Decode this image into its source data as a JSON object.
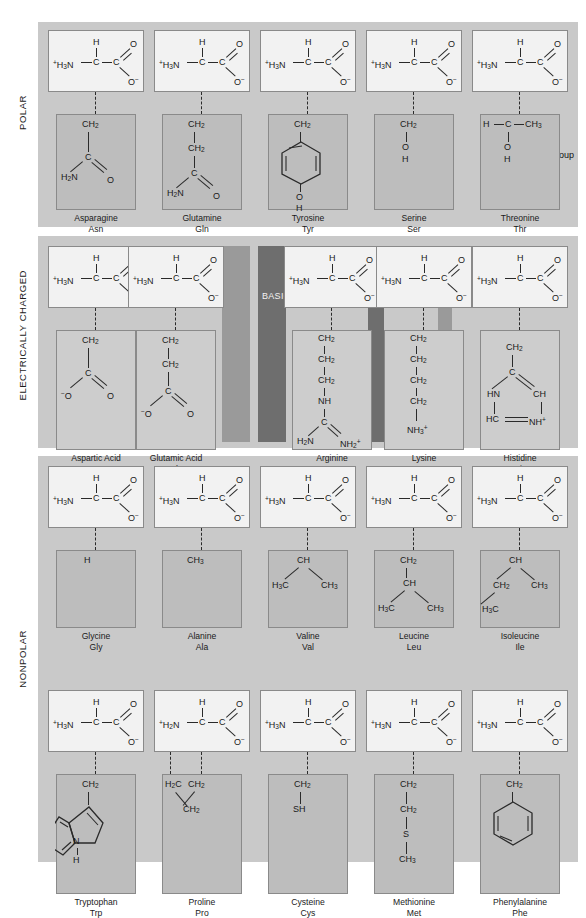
{
  "figure": {
    "sections": [
      {
        "id": "polar",
        "label": "POLAR"
      },
      {
        "id": "charged",
        "label": "ELECTRICALLY CHARGED"
      },
      {
        "id": "nonpolar",
        "label": "NONPOLAR"
      }
    ],
    "subgroup_tags": [
      {
        "id": "acidic",
        "label": "ACIDIC"
      },
      {
        "id": "basic",
        "label": "BASIC"
      }
    ],
    "callouts": [
      {
        "id": "alpha-carbon",
        "line1": "Alpha",
        "line2": "carbon"
      },
      {
        "id": "r-group",
        "line1": "R group",
        "line2": ""
      }
    ]
  },
  "backbone": {
    "amino": "⁺H₃N",
    "amino_proline": "⁺H₂N",
    "alpha_c": "C",
    "alpha_h": "H",
    "carboxyl_c": "C",
    "carbonyl_o": "O",
    "carboxylate_o": "O⁻"
  },
  "groups": {
    "ch2": "CH₂",
    "ch3": "CH₃",
    "ch": "CH",
    "c": "C",
    "h": "H",
    "o": "O",
    "oh": "OH",
    "o_minus": "O⁻",
    "h2n": "H₂N",
    "h3c": "H₃C",
    "h2c": "H₂C",
    "nh": "NH",
    "n": "N",
    "hn": "HN",
    "hc": "HC",
    "nh_plus": "NH⁺",
    "nh2_plus": "NH₂⁺",
    "nh3_plus": "NH₃⁺",
    "sh": "SH",
    "s": "S"
  },
  "amino_acids": {
    "polar": [
      {
        "name": "Asparagine",
        "abbr": "Asn"
      },
      {
        "name": "Glutamine",
        "abbr": "Gln"
      },
      {
        "name": "Tyrosine",
        "abbr": "Tyr"
      },
      {
        "name": "Serine",
        "abbr": "Ser"
      },
      {
        "name": "Threonine",
        "abbr": "Thr"
      }
    ],
    "charged": [
      {
        "name": "Aspartic Acid",
        "abbr": "Asp"
      },
      {
        "name": "Glutamic Acid",
        "abbr": "Glu"
      },
      {
        "name": "Arginine",
        "abbr": "Arg"
      },
      {
        "name": "Lysine",
        "abbr": "Lys"
      },
      {
        "name": "Histidine",
        "abbr": "His"
      }
    ],
    "nonpolar_row1": [
      {
        "name": "Glycine",
        "abbr": "Gly"
      },
      {
        "name": "Alanine",
        "abbr": "Ala"
      },
      {
        "name": "Valine",
        "abbr": "Val"
      },
      {
        "name": "Leucine",
        "abbr": "Leu"
      },
      {
        "name": "Isoleucine",
        "abbr": "Ile"
      }
    ],
    "nonpolar_row2": [
      {
        "name": "Tryptophan",
        "abbr": "Trp"
      },
      {
        "name": "Proline",
        "abbr": "Pro"
      },
      {
        "name": "Cysteine",
        "abbr": "Cys"
      },
      {
        "name": "Methionine",
        "abbr": "Met"
      },
      {
        "name": "Phenylalanine",
        "abbr": "Phe"
      }
    ]
  },
  "colors": {
    "band": "#c9c9c9",
    "backbone_panel": "#f2f2f2",
    "rgroup_panel": "#bdbdbd",
    "acidic_shade": "#9a9a9a",
    "basic_shade": "#6e6e6e",
    "stroke": "#2a2a2a",
    "page": "#ffffff"
  }
}
